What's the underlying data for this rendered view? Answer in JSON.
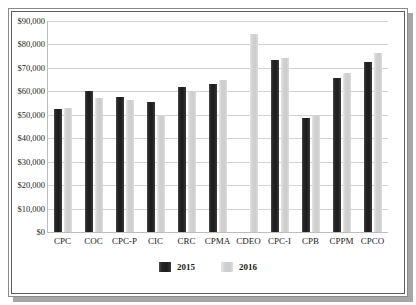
{
  "chart_data": {
    "type": "bar",
    "title": "",
    "subtitle": "",
    "xlabel": "",
    "ylabel": "",
    "ylim": [
      0,
      90000
    ],
    "ytick_values": [
      0,
      10000,
      20000,
      30000,
      40000,
      50000,
      60000,
      70000,
      80000,
      90000
    ],
    "ytick_labels": [
      "$0",
      "$10,000",
      "$20,000",
      "$30,000",
      "$40,000",
      "$50,000",
      "$60,000",
      "$70,000",
      "$80,000",
      "$90,000"
    ],
    "grid": "horizontal",
    "legend_position": "bottom-center",
    "categories": [
      "CPC",
      "COC",
      "CPC-P",
      "CIC",
      "CRC",
      "CPMA",
      "CDEO",
      "CPC-I",
      "CPB",
      "CPPM",
      "CPCO"
    ],
    "series": [
      {
        "name": "2015",
        "color": "#1c1c1c",
        "values": [
          52300,
          60000,
          57500,
          55500,
          62000,
          63100,
          null,
          73500,
          48500,
          65700,
          72400
        ]
      },
      {
        "name": "2016",
        "color": "#d0d0d0",
        "values": [
          53100,
          57300,
          56300,
          49400,
          60100,
          65000,
          84500,
          74200,
          49400,
          67800,
          76400
        ]
      }
    ]
  },
  "legend": {
    "items": [
      {
        "label": "2015",
        "swatch": "dark-swatch"
      },
      {
        "label": "2016",
        "swatch": "light-swatch"
      }
    ]
  },
  "colors": {
    "series_2015": "#1c1c1c",
    "series_2016": "#d0d0d0",
    "gridline": "#d2d2d2",
    "frame_outer": "#8a8a8a",
    "frame_inner": "#5d5d5d",
    "shadow": "#a6a6a6",
    "text": "#231f20",
    "background": "#ffffff"
  }
}
